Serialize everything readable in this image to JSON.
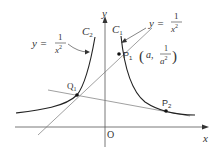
{
  "diagram": {
    "type": "function-graph",
    "axes": {
      "x_label": "x",
      "y_label": "y",
      "origin_label": "O"
    },
    "curves": [
      {
        "id": "C1",
        "label": "C",
        "subscript": "1",
        "equation": "y = 1/x^2",
        "equation_lhs": "y =",
        "numerator": "1",
        "denominator": "x",
        "exponent": "2"
      },
      {
        "id": "C2",
        "label": "C",
        "subscript": "2",
        "equation": "y = 1/x^2",
        "equation_lhs": "y =",
        "numerator": "1",
        "denominator": "x",
        "exponent": "2"
      }
    ],
    "points": [
      {
        "id": "P1",
        "label": "P",
        "subscript": "1",
        "coord_open": "(",
        "coord_a": "a,",
        "coord_num": "1",
        "coord_den": "a",
        "coord_exp": "2",
        "coord_close": ")"
      },
      {
        "id": "P2",
        "label": "P",
        "subscript": "2"
      },
      {
        "id": "Q1",
        "label": "Q",
        "subscript": "1"
      }
    ],
    "colors": {
      "curve": "#222222",
      "line": "#666666",
      "axis": "#555555"
    }
  }
}
